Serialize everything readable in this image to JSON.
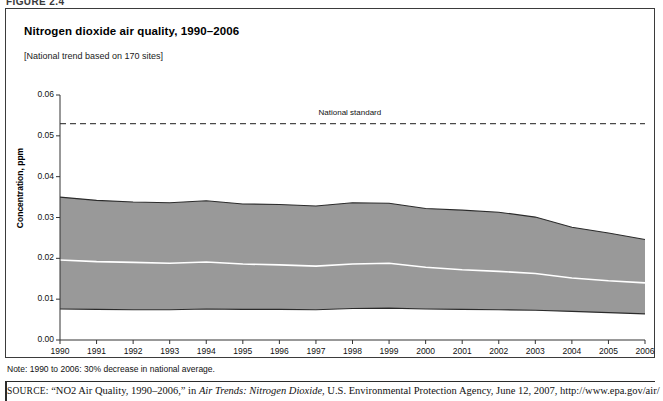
{
  "figure": {
    "tag": "FIGURE 2.4",
    "title": "Nitrogen dioxide air quality, 1990–2006",
    "subtitle": "[National trend based on 170 sites]",
    "note": "Note: 1990 to 2006: 30% decrease in national average.",
    "source_prefix": "SOURCE:",
    "source_part1": " “NO2 Air Quality, 1990–2006,” in ",
    "source_italic": "Air Trends: Nitrogen Dioxide",
    "source_part2": ", U.S. Environmental Protection Agency, June 12, 2007, http://www.epa.gov/air/"
  },
  "colors": {
    "band_fill": "#999999",
    "band_edge": "#2b2b2b",
    "mean_line": "#ffffff",
    "standard_line": "#4a4a4a",
    "axis": "#333333"
  },
  "chart_data": {
    "type": "area",
    "title": "Nitrogen dioxide air quality, 1990–2006",
    "subtitle": "[National trend based on 170 sites]",
    "xlabel": "",
    "ylabel": "Concentration, ppm",
    "ylim": [
      0.0,
      0.06
    ],
    "yticks": [
      0.0,
      0.01,
      0.02,
      0.03,
      0.04,
      0.05,
      0.06
    ],
    "ytick_labels": [
      "0.00",
      "0.01",
      "0.02",
      "0.03",
      "0.04",
      "0.05",
      "0.06"
    ],
    "grid": false,
    "legend": "none",
    "categories": [
      1990,
      1991,
      1992,
      1993,
      1994,
      1995,
      1996,
      1997,
      1998,
      1999,
      2000,
      2001,
      2002,
      2003,
      2004,
      2005,
      2006
    ],
    "xtick_labels": [
      "1990",
      "1991",
      "1992",
      "1993",
      "1994",
      "1995",
      "1996",
      "1997",
      "1998",
      "1999",
      "2000",
      "2001",
      "2002",
      "2003",
      "2004",
      "2005",
      "2006"
    ],
    "series": [
      {
        "name": "90th percentile (upper bound)",
        "values": [
          0.035,
          0.0342,
          0.0338,
          0.0336,
          0.0341,
          0.0333,
          0.0332,
          0.0328,
          0.0336,
          0.0335,
          0.0322,
          0.0318,
          0.0313,
          0.0301,
          0.0276,
          0.0262,
          0.0246
        ]
      },
      {
        "name": "National average (mean)",
        "values": [
          0.0196,
          0.0192,
          0.019,
          0.0188,
          0.0191,
          0.0186,
          0.0184,
          0.0181,
          0.0186,
          0.0188,
          0.0178,
          0.0172,
          0.0168,
          0.0163,
          0.0152,
          0.0145,
          0.014
        ]
      },
      {
        "name": "10th percentile (lower bound)",
        "values": [
          0.0076,
          0.0075,
          0.0074,
          0.0074,
          0.0076,
          0.0075,
          0.0075,
          0.0074,
          0.0077,
          0.0078,
          0.0076,
          0.0075,
          0.0074,
          0.0073,
          0.007,
          0.0067,
          0.0064
        ]
      }
    ],
    "annotations": [
      {
        "text": "National standard",
        "value": 0.053,
        "type": "hline-dashed"
      }
    ]
  }
}
